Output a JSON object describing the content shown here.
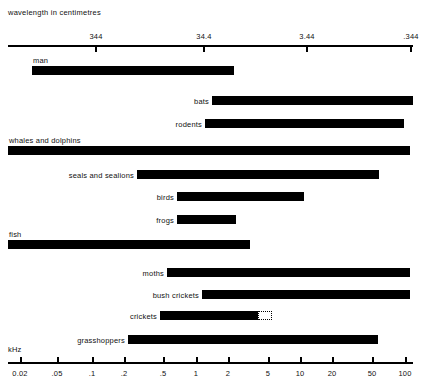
{
  "figure": {
    "top_axis_caption": "wavelength in centimetres",
    "bottom_axis_caption": "kHz"
  },
  "chart_data": {
    "type": "bar",
    "orientation": "horizontal",
    "title": "",
    "xlabel": "kHz",
    "top_axis_label": "wavelength in centimetres",
    "grid": false,
    "legend": "none",
    "x_scale": "log",
    "x_tick_labels": [
      "0.02",
      ".05",
      ".1",
      ".2",
      ".5",
      "1",
      "2",
      "5",
      "10",
      "20",
      "50",
      "100"
    ],
    "x_tick_values": [
      0.02,
      0.05,
      0.1,
      0.2,
      0.5,
      1,
      2,
      5,
      10,
      20,
      50,
      100
    ],
    "x_tick_px": [
      20,
      57,
      92,
      124,
      163,
      196,
      228,
      268,
      300,
      332,
      372,
      405
    ],
    "top_tick_labels": [
      "344",
      "34.4",
      "3.44",
      ".344"
    ],
    "top_tick_values": [
      344,
      34.4,
      3.44,
      0.344
    ],
    "top_tick_px": [
      95,
      203,
      306,
      410
    ],
    "categories": [
      "man",
      "bats",
      "rodents",
      "whales and dolphins",
      "seals and sealions",
      "birds",
      "frogs",
      "fish",
      "moths",
      "bush crickets",
      "crickets",
      "grasshoppers"
    ],
    "bars": [
      {
        "label": "man",
        "x_start_khz": 0.02,
        "x_end_khz": 20,
        "px_start": 32,
        "px_end": 234,
        "label_position": "above",
        "dotted_extension": false
      },
      {
        "label": "bats",
        "x_start_khz": 1.0,
        "x_end_khz": 120,
        "px_start": 212,
        "px_end": 413,
        "label_position": "left",
        "dotted_extension": false
      },
      {
        "label": "rodents",
        "x_start_khz": 0.9,
        "x_end_khz": 90,
        "px_start": 205,
        "px_end": 404,
        "label_position": "left",
        "dotted_extension": false
      },
      {
        "label": "whales and dolphins",
        "x_start_khz": 0.015,
        "x_end_khz": 110,
        "px_start": 8,
        "px_end": 410,
        "label_position": "above",
        "dotted_extension": false
      },
      {
        "label": "seals and sealions",
        "x_start_khz": 0.25,
        "x_end_khz": 55,
        "px_start": 137,
        "px_end": 379,
        "label_position": "left",
        "dotted_extension": false
      },
      {
        "label": "birds",
        "x_start_khz": 0.6,
        "x_end_khz": 11,
        "px_start": 177,
        "px_end": 304,
        "label_position": "left",
        "dotted_extension": false
      },
      {
        "label": "frogs",
        "x_start_khz": 0.6,
        "x_end_khz": 2.2,
        "px_start": 177,
        "px_end": 236,
        "label_position": "left",
        "dotted_extension": false
      },
      {
        "label": "fish",
        "x_start_khz": 0.015,
        "x_end_khz": 3.2,
        "px_start": 8,
        "px_end": 250,
        "label_position": "above",
        "dotted_extension": false
      },
      {
        "label": "moths",
        "x_start_khz": 0.55,
        "x_end_khz": 110,
        "px_start": 167,
        "px_end": 410,
        "label_position": "left",
        "dotted_extension": false
      },
      {
        "label": "bush crickets",
        "x_start_khz": 1.3,
        "x_end_khz": 110,
        "px_start": 202,
        "px_end": 410,
        "label_position": "left",
        "dotted_extension": false
      },
      {
        "label": "crickets",
        "x_start_khz": 0.45,
        "x_end_khz": 4.3,
        "px_start": 160,
        "px_end": 258,
        "label_position": "left",
        "dotted_extension": true,
        "dotted_px_end": 272
      },
      {
        "label": "grasshoppers",
        "x_start_khz": 0.2,
        "x_end_khz": 52,
        "px_start": 128,
        "px_end": 378,
        "label_position": "left",
        "dotted_extension": false
      }
    ]
  },
  "layout": {
    "top_axis_y": 45,
    "bottom_axis_y": 362,
    "axis_left": 8,
    "axis_right": 413,
    "bar_height": 9,
    "row_ys": [
      66,
      96,
      119,
      146,
      170,
      192,
      215,
      240,
      268,
      290,
      311,
      335
    ],
    "label_ys": [
      56,
      96,
      119,
      136,
      170,
      192,
      215,
      230,
      268,
      290,
      311,
      335
    ]
  }
}
